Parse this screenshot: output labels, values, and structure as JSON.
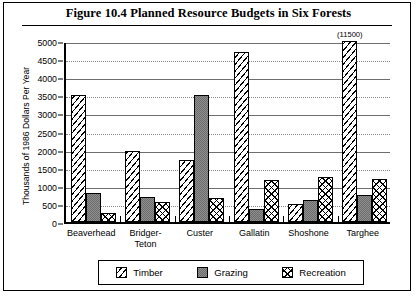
{
  "figure": {
    "title": "Figure 10.4   Planned Resource Budgets in Six Forests"
  },
  "chart_data": {
    "type": "bar",
    "title": "Figure 10.4   Planned Resource Budgets in Six Forests",
    "xlabel": "",
    "ylabel": "Thousands of 1986 Dollars Per Year",
    "ylim": [
      0,
      5000
    ],
    "ytick_labels": [
      "5000",
      "4500",
      "4000",
      "3500",
      "3000",
      "2500",
      "2000",
      "1500",
      "1000",
      "500",
      "0"
    ],
    "ytick_values": [
      5000,
      4500,
      4000,
      3500,
      3000,
      2500,
      2000,
      1500,
      1000,
      500,
      0
    ],
    "grid": true,
    "legend_position": "bottom",
    "categories": [
      "Beaverhead",
      "Bridger-Teton",
      "Custer",
      "Gallatin",
      "Shoshone",
      "Targhee"
    ],
    "category_lines": [
      [
        "Beaverhead"
      ],
      [
        "Bridger-",
        "Teton"
      ],
      [
        "Custer"
      ],
      [
        "Gallatin"
      ],
      [
        "Shoshone"
      ],
      [
        "Targhee"
      ]
    ],
    "series": [
      {
        "name": "Timber",
        "pattern": "diagonal-hatch",
        "values": [
          3500,
          1950,
          1700,
          4700,
          500,
          5000
        ],
        "annotations": [
          null,
          null,
          null,
          null,
          null,
          "(11500)"
        ],
        "clipped": [
          false,
          false,
          false,
          false,
          false,
          true
        ],
        "actual_values": [
          3500,
          1950,
          1700,
          4700,
          500,
          11500
        ]
      },
      {
        "name": "Grazing",
        "pattern": "solid-gray",
        "values": [
          800,
          700,
          3500,
          350,
          600,
          750
        ]
      },
      {
        "name": "Recreation",
        "pattern": "cross-hatch",
        "values": [
          250,
          550,
          650,
          1150,
          1250,
          1200
        ]
      }
    ]
  },
  "legend": {
    "entries": [
      {
        "label": "Timber",
        "swatch": "diagonal-hatch-swatch"
      },
      {
        "label": "Grazing",
        "swatch": "solid-gray-swatch"
      },
      {
        "label": "Recreation",
        "swatch": "cross-hatch-swatch"
      }
    ]
  }
}
